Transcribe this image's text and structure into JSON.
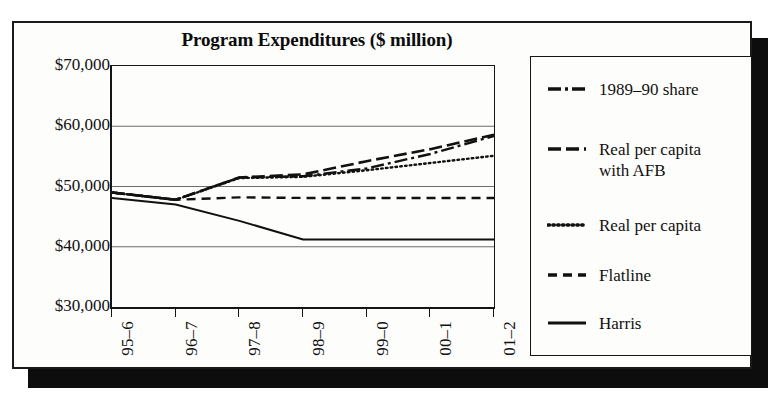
{
  "chart_data": {
    "type": "line",
    "title": "Program Expenditures ($ million)",
    "xlabel": "",
    "ylabel": "",
    "grid": true,
    "legend_position": "right",
    "categories": [
      "95–6",
      "96–7",
      "97–8",
      "98–9",
      "99–0",
      "00–1",
      "01–2"
    ],
    "x": [
      0,
      1,
      2,
      3,
      4,
      5,
      6
    ],
    "ylim": [
      30000,
      70000
    ],
    "ytick_values": [
      70000,
      60000,
      50000,
      40000,
      30000
    ],
    "ytick_labels": [
      "$70,000",
      "$60,000",
      "$50,000",
      "$40,000",
      "$30,000"
    ],
    "series": [
      {
        "name": "1989–90 share",
        "style": "dash-dot",
        "values": [
          49000,
          47800,
          51500,
          51700,
          53000,
          55400,
          58400
        ]
      },
      {
        "name": "Real per capita with AFB",
        "style": "dashed-long",
        "values": [
          49000,
          47800,
          51500,
          52000,
          54200,
          56200,
          58600
        ]
      },
      {
        "name": "Real per capita",
        "style": "dotted",
        "values": [
          49000,
          47800,
          51400,
          51600,
          52700,
          53900,
          55100
        ]
      },
      {
        "name": "Flatline",
        "style": "dashed",
        "values": [
          49000,
          47800,
          48200,
          48100,
          48100,
          48100,
          48100
        ]
      },
      {
        "name": "Harris",
        "style": "solid",
        "values": [
          48100,
          47000,
          44300,
          41200,
          41200,
          41200,
          41200
        ]
      }
    ]
  },
  "legend": {
    "items": [
      {
        "label": "1989–90 share",
        "style": "dash-dot"
      },
      {
        "label": "Real per capita\nwith AFB",
        "style": "dashed-long"
      },
      {
        "label": "Real per capita",
        "style": "dotted"
      },
      {
        "label": "Flatline",
        "style": "dashed"
      },
      {
        "label": "Harris",
        "style": "solid"
      }
    ]
  },
  "colors": {
    "ink": "#111111",
    "grid": "#6d6d6d",
    "paper": "#fdfdfb",
    "shadow": "#0d0d0d"
  }
}
